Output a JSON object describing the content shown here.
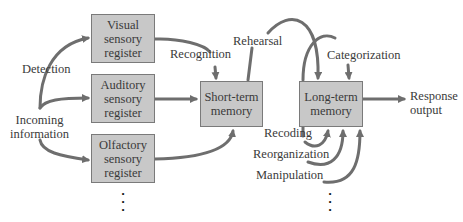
{
  "diagram": {
    "nodes": {
      "visual": "Visual\nsensory\nregister",
      "auditory": "Auditory\nsensory\nregister",
      "olfactory": "Olfactory\nsensory\nregister",
      "short_term": "Short-term\nmemory",
      "long_term": "Long-term\nmemory"
    },
    "labels": {
      "detection": "Detection",
      "incoming": "Incoming\ninformation",
      "recognition": "Recognition",
      "rehearsal": "Rehearsal",
      "categorization": "Categorization",
      "response": "Response\noutput",
      "recoding": "Recoding",
      "reorganization": "Reorganization",
      "manipulation": "Manipulation",
      "ellipsis_sensory": "•\n•\n•",
      "ellipsis_ltm": "•\n•\n•"
    },
    "colors": {
      "box_fill": "#c8c8c8",
      "box_border": "#7a7a7a",
      "arrow": "#6e6e6e"
    }
  }
}
